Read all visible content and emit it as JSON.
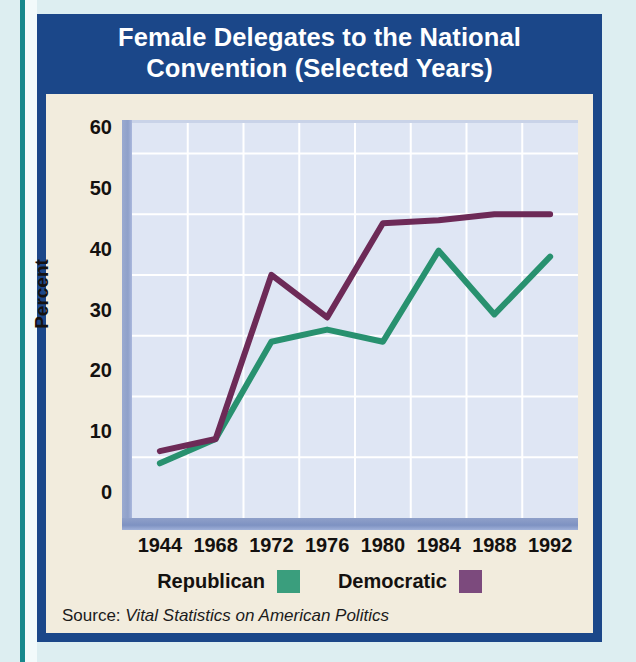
{
  "title": {
    "line1": "Female Delegates to the National",
    "line2": "Convention (Selected Years)"
  },
  "source": {
    "prefix": "Source:",
    "publication": "Vital Statistics on American Politics"
  },
  "colors": {
    "republican": "#28916f",
    "democratic": "#6d2a57",
    "republican_swatch": "#3a9e7d",
    "democratic_swatch": "#7c4a7d",
    "title_bar": "#1b4789",
    "panel": "#f2ecdd",
    "plot_background": "#dfe6f4",
    "gridline": "#ffffff",
    "page_background": "#ddeef1",
    "accent_rule": "#17888c"
  },
  "chart_data": {
    "type": "line",
    "title": "Female Delegates to the National Convention (Selected Years)",
    "xlabel": "",
    "ylabel": "Percent",
    "categories": [
      "1944",
      "1968",
      "1972",
      "1976",
      "1980",
      "1984",
      "1988",
      "1992"
    ],
    "x_tick_labels": [
      "1944",
      "1968",
      "1972",
      "1976",
      "1980",
      "1984",
      "1988",
      "1992"
    ],
    "y_tick_labels": [
      "0",
      "10",
      "20",
      "30",
      "40",
      "50",
      "60"
    ],
    "y_ticks": [
      0,
      10,
      20,
      30,
      40,
      50,
      60
    ],
    "ylim": [
      0,
      65
    ],
    "grid": true,
    "legend_position": "bottom-center",
    "series": [
      {
        "name": "Republican",
        "color": "#28916f",
        "values": [
          9,
          13,
          29,
          31,
          29,
          44,
          33.5,
          43
        ]
      },
      {
        "name": "Democratic",
        "color": "#6d2a57",
        "values": [
          11,
          13,
          40,
          33,
          48.5,
          49,
          50,
          50
        ]
      }
    ]
  }
}
